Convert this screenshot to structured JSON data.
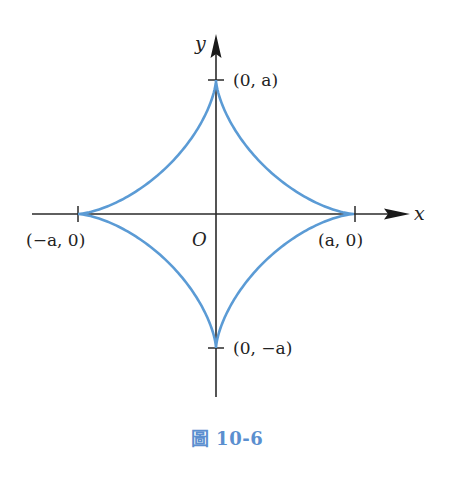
{
  "figure": {
    "caption": "圖 10-6",
    "caption_color": "#5b8fcf",
    "curve_color": "#5b9bd5",
    "axis_color": "#2a2a2a",
    "curve_type": "astroid",
    "equation_hint": "x^(2/3) + y^(2/3) = a^(2/3)",
    "axes": {
      "x_label": "x",
      "y_label": "y",
      "origin_label": "O"
    },
    "points": {
      "top": "(0, a)",
      "bottom": "(0, −a)",
      "left": "(−a, 0)",
      "right": "(a, 0)"
    },
    "geometry": {
      "origin_px": [
        216,
        214
      ],
      "radius_x_px": 138,
      "radius_y_px": 134,
      "x_axis_range_px": [
        32,
        408
      ],
      "y_axis_range_px": [
        36,
        397
      ]
    }
  }
}
